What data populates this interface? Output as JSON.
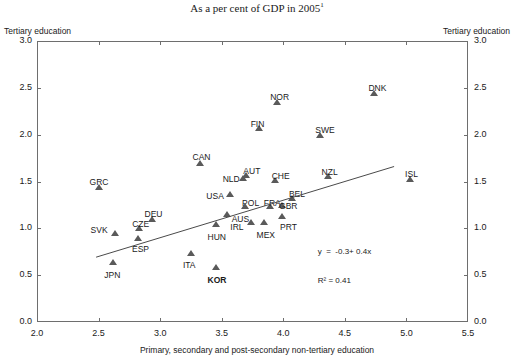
{
  "chart_data": {
    "type": "scatter",
    "title": "",
    "subtitle": "As a per cent of GDP in 2005",
    "subtitle_footnote": "1",
    "xlabel": "Primary, secondary and post-secondary non-tertiary education",
    "ylabel": "Tertiary education",
    "ylabel_right": "Tertiary education",
    "xlim": [
      2.0,
      5.5
    ],
    "ylim": [
      0.0,
      3.0
    ],
    "xticks": [
      "2.0",
      "2.5",
      "3.0",
      "3.5",
      "4.0",
      "4.5",
      "5.0",
      "5.5"
    ],
    "yticks": [
      "0.0",
      "0.5",
      "1.0",
      "1.5",
      "2.0",
      "2.5",
      "3.0"
    ],
    "xtick_values": [
      2.0,
      2.5,
      3.0,
      3.5,
      4.0,
      4.5,
      5.0,
      5.5
    ],
    "ytick_values": [
      0.0,
      0.5,
      1.0,
      1.5,
      2.0,
      2.5,
      3.0
    ],
    "grid": false,
    "legend": "none",
    "marker_color": "#5a5a5a",
    "line_color": "#4a4a4a",
    "axis_color": "#6e6e6e",
    "annotations": {
      "equation": "y  =  -0.3+ 0.4x",
      "r_squared": "R² = 0.41"
    },
    "regression": {
      "slope": 0.4,
      "intercept": -0.3,
      "r2": 0.41,
      "x_start": 2.48,
      "x_end": 4.9
    },
    "points": [
      {
        "label": "GRC",
        "x": 2.5,
        "y": 1.42,
        "label_dx": -9,
        "label_dy": -11,
        "bold": false
      },
      {
        "label": "JPN",
        "x": 2.62,
        "y": 0.62,
        "label_dx": -9,
        "label_dy": 7,
        "bold": false
      },
      {
        "label": "SVK",
        "x": 2.63,
        "y": 0.93,
        "label_dx": -24,
        "label_dy": -9,
        "bold": false
      },
      {
        "label": "CZE",
        "x": 2.83,
        "y": 0.98,
        "label_dx": -7,
        "label_dy": -10,
        "bold": false
      },
      {
        "label": "ESP",
        "x": 2.82,
        "y": 0.88,
        "label_dx": -6,
        "label_dy": 5,
        "bold": false
      },
      {
        "label": "DEU",
        "x": 2.93,
        "y": 1.08,
        "label_dx": -7,
        "label_dy": -11,
        "bold": false
      },
      {
        "label": "ITA",
        "x": 3.25,
        "y": 0.72,
        "label_dx": -8,
        "label_dy": 6,
        "bold": false
      },
      {
        "label": "CAN",
        "x": 3.32,
        "y": 1.68,
        "label_dx": -7,
        "label_dy": -12,
        "bold": false
      },
      {
        "label": "HUN",
        "x": 3.45,
        "y": 1.03,
        "label_dx": -8,
        "label_dy": 7,
        "bold": false
      },
      {
        "label": "KOR",
        "x": 3.45,
        "y": 0.57,
        "label_dx": -8,
        "label_dy": 7,
        "bold": true
      },
      {
        "label": "AUS",
        "x": 3.54,
        "y": 1.13,
        "label_dx": 5,
        "label_dy": -1,
        "bold": false
      },
      {
        "label": "USA",
        "x": 3.57,
        "y": 1.35,
        "label_dx": -24,
        "label_dy": -4,
        "bold": false
      },
      {
        "label": "NLD",
        "x": 3.67,
        "y": 1.52,
        "label_dx": -20,
        "label_dy": -5,
        "bold": false
      },
      {
        "label": "AUT",
        "x": 3.7,
        "y": 1.55,
        "label_dx": -3,
        "label_dy": -10,
        "bold": false
      },
      {
        "label": "POL",
        "x": 3.69,
        "y": 1.22,
        "label_dx": -3,
        "label_dy": -9,
        "bold": false
      },
      {
        "label": "IRL",
        "x": 3.74,
        "y": 1.05,
        "label_dx": -21,
        "label_dy": -1,
        "bold": false
      },
      {
        "label": "MEX",
        "x": 3.84,
        "y": 1.05,
        "label_dx": -7,
        "label_dy": 7,
        "bold": false
      },
      {
        "label": "FRA",
        "x": 3.89,
        "y": 1.22,
        "label_dx": -6,
        "label_dy": -9,
        "bold": false
      },
      {
        "label": "CHE",
        "x": 3.93,
        "y": 1.5,
        "label_dx": -3,
        "label_dy": -10,
        "bold": false
      },
      {
        "label": "GBR",
        "x": 3.99,
        "y": 1.23,
        "label_dx": -3,
        "label_dy": -5,
        "bold": false
      },
      {
        "label": "PRT",
        "x": 3.99,
        "y": 1.11,
        "label_dx": -2,
        "label_dy": 5,
        "bold": false
      },
      {
        "label": "BEL",
        "x": 4.07,
        "y": 1.3,
        "label_dx": -3,
        "label_dy": -10,
        "bold": false
      },
      {
        "label": "FIN",
        "x": 3.8,
        "y": 2.05,
        "label_dx": -8,
        "label_dy": -10,
        "bold": false
      },
      {
        "label": "NOR",
        "x": 3.95,
        "y": 2.33,
        "label_dx": -7,
        "label_dy": -11,
        "bold": false
      },
      {
        "label": "NZL",
        "x": 4.36,
        "y": 1.54,
        "label_dx": -6,
        "label_dy": -10,
        "bold": false
      },
      {
        "label": "SWE",
        "x": 4.3,
        "y": 1.98,
        "label_dx": -5,
        "label_dy": -11,
        "bold": false
      },
      {
        "label": "DNK",
        "x": 4.74,
        "y": 2.42,
        "label_dx": -6,
        "label_dy": -11,
        "bold": false
      },
      {
        "label": "ISL",
        "x": 5.03,
        "y": 1.51,
        "label_dx": -5,
        "label_dy": -11,
        "bold": false
      }
    ]
  }
}
